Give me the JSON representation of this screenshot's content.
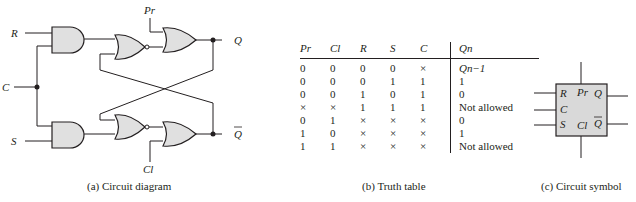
{
  "panel_a": {
    "caption": "(a) Circuit diagram",
    "labels": {
      "R": "R",
      "C": "C",
      "S": "S",
      "Pr": "Pr",
      "Cl": "Cl",
      "Q": "Q",
      "Qbar": "Q"
    },
    "gate_fill": "#e0e0e0",
    "line_color": "#231f20"
  },
  "panel_b": {
    "caption": "(b) Truth table",
    "headers": [
      "Pr",
      "Cl",
      "R",
      "S",
      "C",
      "Qn"
    ],
    "rows": [
      [
        "0",
        "0",
        "0",
        "0",
        "×",
        "Qn−1"
      ],
      [
        "0",
        "0",
        "0",
        "1",
        "1",
        "1"
      ],
      [
        "0",
        "0",
        "1",
        "0",
        "1",
        "0"
      ],
      [
        "×",
        "×",
        "1",
        "1",
        "1",
        "Not allowed"
      ],
      [
        "0",
        "1",
        "×",
        "×",
        "×",
        "0"
      ],
      [
        "1",
        "0",
        "×",
        "×",
        "×",
        "1"
      ],
      [
        "1",
        "1",
        "×",
        "×",
        "×",
        "Not allowed"
      ]
    ]
  },
  "panel_c": {
    "caption": "(c) Circuit symbol",
    "labels": {
      "R": "R",
      "C": "C",
      "S": "S",
      "Pr": "Pr",
      "Cl": "Cl",
      "Q": "Q",
      "Qbar": "Q"
    },
    "box_fill": "#d9d9d9"
  }
}
